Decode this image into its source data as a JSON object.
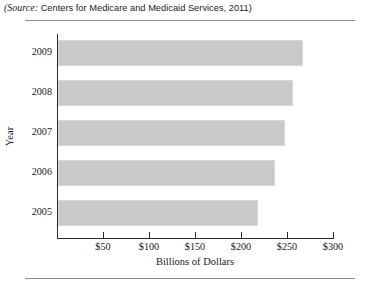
{
  "source_note": {
    "italic_part": "(Source:",
    "rest": " Centers for Medicare and Medicaid Services, 2011)"
  },
  "chart_data": {
    "type": "bar",
    "orientation": "horizontal",
    "title": "",
    "xlabel": "Billions of Dollars",
    "ylabel": "Year",
    "categories": [
      "2005",
      "2006",
      "2007",
      "2008",
      "2009"
    ],
    "values": [
      217,
      236,
      247,
      255,
      266
    ],
    "xlim": [
      0,
      300
    ],
    "xticks": [
      0,
      50,
      100,
      150,
      200,
      250,
      300
    ],
    "xtick_labels": [
      "",
      "$50",
      "$100",
      "$150",
      "$200",
      "$250",
      "$300"
    ],
    "grid": false,
    "legend": false,
    "bar_color": "#c9c9c9",
    "axis_color": "#2b2b2b"
  }
}
